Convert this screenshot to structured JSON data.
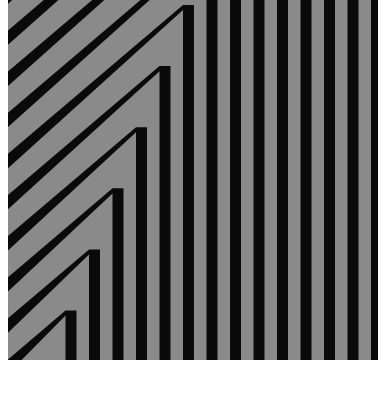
{
  "artwork": {
    "description": "Op-art pattern of nested chevrons: diagonal stripes rising to the right that turn into vertical stripes",
    "colors": {
      "background": "#ffffff",
      "stripe_dark": "#0a0a0a",
      "stripe_light": "#8a8a8a"
    },
    "stripe_period_px": 23.5,
    "dark_width_px": 11
  }
}
